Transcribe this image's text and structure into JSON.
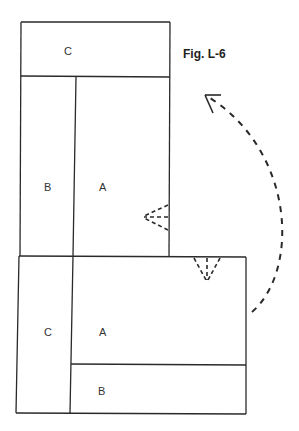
{
  "figure": {
    "caption": "Fig. L-6"
  },
  "upper_panel": {
    "top_section_label": "C",
    "left_section_label": "B",
    "right_section_label": "A"
  },
  "lower_panel": {
    "left_section_label": "C",
    "main_section_label": "A",
    "bottom_section_label": "B"
  },
  "annotations": {
    "fold_marker_upper": "fold-indicator-pointing-left",
    "fold_marker_lower": "fold-indicator-pointing-down",
    "rotation_arrow": "dashed-curved-arrow-counterclockwise"
  },
  "colors": {
    "line": "#2a2a2a",
    "background": "#ffffff"
  }
}
